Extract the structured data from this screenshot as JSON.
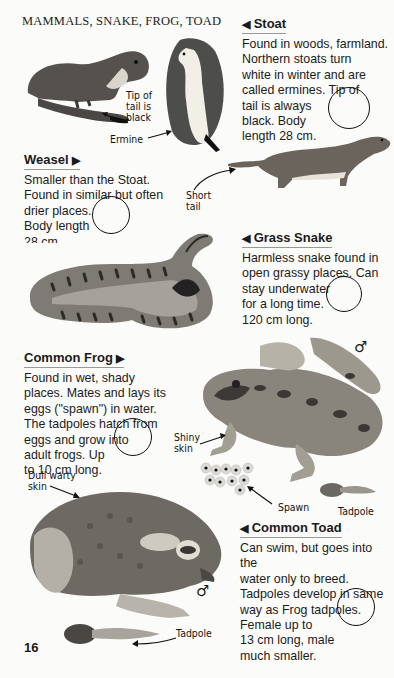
{
  "page": {
    "running_head": "MAMMALS, SNAKE, FROG, TOAD",
    "page_number": "16"
  },
  "entries": {
    "stoat": {
      "title": "Stoat",
      "arrow": "◀",
      "lines": [
        "Found  in woods, farmland.",
        "Northern stoats turn",
        "white in winter and are",
        "called ermines. Tip of",
        "tail is always",
        "black. Body",
        "length 28 cm."
      ]
    },
    "weasel": {
      "title": "Weasel",
      "arrow": "▶",
      "lines": [
        "Smaller than the Stoat.",
        "Found in similar but often",
        "drier places.",
        "Body length",
        "28 cm"
      ]
    },
    "grass_snake": {
      "title": "Grass Snake",
      "arrow": "◀",
      "lines": [
        "Harmless snake found in",
        "open grassy places. Can",
        "stay underwater",
        "for a long time.",
        "120 cm long."
      ]
    },
    "common_frog": {
      "title": "Common Frog",
      "arrow": "▶",
      "lines": [
        "Found in wet, shady",
        "places. Mates and lays its",
        "eggs (\"spawn\") in water.",
        "The tadpoles hatch from",
        "eggs and grow into",
        "adult frogs. Up",
        "to 10 cm long."
      ]
    },
    "common_toad": {
      "title": "Common Toad",
      "arrow": "◀",
      "lines": [
        "Can swim, but goes into the",
        "water only to breed.",
        "Tadpoles develop in same",
        "way as Frog tadpoles.",
        "Female up to",
        "13 cm long, male",
        "much smaller."
      ]
    }
  },
  "labels": {
    "tip_of_tail": [
      "Tip of",
      "tail is",
      "black"
    ],
    "ermine": "Ermine",
    "short_tail": [
      "Short",
      "tail"
    ],
    "shiny_skin": [
      "Shiny",
      "skin"
    ],
    "spawn": "Spawn",
    "frog_tadpole": "Tadpole",
    "dull_warty_skin": [
      "Dull warty",
      "skin"
    ],
    "toad_tadpole": "Tadpole",
    "male_symbol_frog": "♂",
    "male_symbol_toad": "♂"
  },
  "colors": {
    "background": "#fbfbfa",
    "text": "#1a1a1a",
    "illustration_dark": "#4a4a48",
    "illustration_mid": "#8a8a86",
    "illustration_light": "#c9c9c4"
  }
}
